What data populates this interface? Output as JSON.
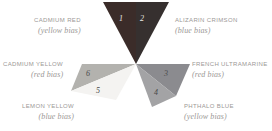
{
  "diagram": {
    "background_color": "#ffffff",
    "center": {
      "x": 136,
      "y": 64
    },
    "label_color": "#9b9896"
  },
  "wedges": [
    {
      "number": "1",
      "pigment": "CADMIUM RED",
      "bias": "(yellow bias)",
      "color": "#3b2c29",
      "number_color": "#e9e7e4",
      "group": "reds"
    },
    {
      "number": "2",
      "pigment": "ALIZARIN CRIMSON",
      "bias": "(blue bias)",
      "color": "#36302f",
      "number_color": "#e9e7e4",
      "group": "reds"
    },
    {
      "number": "3",
      "pigment": "FRENCH ULTRAMARINE",
      "bias": "(red bias)",
      "color": "#8b8b8f",
      "number_color": "#4a4a4a",
      "group": "blues"
    },
    {
      "number": "4",
      "pigment": "PHTHALO BLUE",
      "bias": "(yellow bias)",
      "color": "#a3a3a5",
      "number_color": "#4a4a4a",
      "group": "blues"
    },
    {
      "number": "5",
      "pigment": "LEMON YELLOW",
      "bias": "(blue bias)",
      "color": "#f4f3f1",
      "number_color": "#4a4a4a",
      "group": "yellows"
    },
    {
      "number": "6",
      "pigment": "CADMIUM YELLOW",
      "bias": "(red bias)",
      "color": "#b3b2ae",
      "number_color": "#4a4a4a",
      "group": "yellows"
    }
  ],
  "labels": {
    "cadmium_red": {
      "pigment": "CADMIUM RED",
      "bias": "(yellow bias)"
    },
    "alizarin_crimson": {
      "pigment": "ALIZARIN CRIMSON",
      "bias": "(blue bias)"
    },
    "cadmium_yellow": {
      "pigment": "CADMIUM YELLOW",
      "bias": "(red bias)"
    },
    "french_ultramarine": {
      "pigment": "FRENCH ULTRAMARINE",
      "bias": "(red bias)"
    },
    "lemon_yellow": {
      "pigment": "LEMON YELLOW",
      "bias": "(blue bias)"
    },
    "phthalo_blue": {
      "pigment": "PHTHALO BLUE",
      "bias": "(yellow bias)"
    }
  }
}
